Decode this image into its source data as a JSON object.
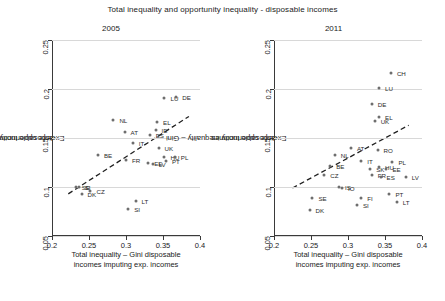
{
  "figure": {
    "title": "Total inequality and opportunity inequality - disposable incomes"
  },
  "axes": {
    "x_title_line1": "Total inequality – Gini disposable",
    "x_title_line2": "incomes imputing exp. incomes",
    "y_title_line1": "Ex-ante opportunity inequality – Gini",
    "y_title_line2": "disposable incomes",
    "x_ticks": [
      "0.2",
      "0.25",
      "0.3",
      "0.35",
      "0.4"
    ],
    "y_ticks": [
      "0.05",
      "0.1",
      "0.15",
      "0.2",
      "0.25"
    ],
    "xlim": [
      0.2,
      0.4
    ],
    "ylim": [
      0.05,
      0.25
    ],
    "marker_color": "#6e6e6e",
    "grid_color": "#d8d8d8",
    "axis_color": "#3a3a3a"
  },
  "chart_data": {
    "type": "scatter",
    "title": "Total inequality and opportunity inequality - disposable incomes",
    "xlabel": "Total inequality – Gini disposable incomes imputing exp. incomes",
    "ylabel": "Ex-ante opportunity inequality – Gini disposable incomes",
    "xlim": [
      0.2,
      0.4
    ],
    "ylim": [
      0.05,
      0.25
    ],
    "grid": true,
    "legend": "none",
    "panels": [
      {
        "name": "2005",
        "label": "2005",
        "trendline": {
          "x0": 0.222,
          "y0": 0.093,
          "x1": 0.385,
          "y1": 0.172
        },
        "points": [
          {
            "label": "SE",
            "x": 0.232,
            "y": 0.1,
            "lx": 6,
            "ly": 0
          },
          {
            "label": "DK",
            "x": 0.24,
            "y": 0.093,
            "lx": 6,
            "ly": 0
          },
          {
            "label": "SI",
            "x": 0.236,
            "y": 0.1,
            "lx": 6,
            "ly": 0
          },
          {
            "label": "BE",
            "x": 0.262,
            "y": 0.133,
            "lx": 6,
            "ly": 0
          },
          {
            "label": "CZ",
            "x": 0.252,
            "y": 0.096,
            "lx": 6,
            "ly": 0
          },
          {
            "label": "NL",
            "x": 0.283,
            "y": 0.168,
            "lx": 6,
            "ly": 0
          },
          {
            "label": "AT",
            "x": 0.298,
            "y": 0.156,
            "lx": 6,
            "ly": 0
          },
          {
            "label": "FR",
            "x": 0.3,
            "y": 0.128,
            "lx": 6,
            "ly": 0
          },
          {
            "label": "IT",
            "x": 0.309,
            "y": 0.145,
            "lx": 6,
            "ly": 0
          },
          {
            "label": "LT",
            "x": 0.313,
            "y": 0.086,
            "lx": 6,
            "ly": 0
          },
          {
            "label": "SI",
            "x": 0.303,
            "y": 0.078,
            "lx": 6,
            "ly": 0
          },
          {
            "label": "ES",
            "x": 0.332,
            "y": 0.153,
            "lx": 6,
            "ly": 0
          },
          {
            "label": "IE",
            "x": 0.34,
            "y": 0.158,
            "lx": 6,
            "ly": 0
          },
          {
            "label": "EE",
            "x": 0.33,
            "y": 0.124,
            "lx": 6,
            "ly": 0
          },
          {
            "label": "LV",
            "x": 0.336,
            "y": 0.123,
            "lx": 6,
            "ly": 0
          },
          {
            "label": "UK",
            "x": 0.344,
            "y": 0.14,
            "lx": 6,
            "ly": 0
          },
          {
            "label": "HU",
            "x": 0.352,
            "y": 0.131,
            "lx": 6,
            "ly": 0
          },
          {
            "label": "PT",
            "x": 0.354,
            "y": 0.127,
            "lx": 6,
            "ly": 0
          },
          {
            "label": "PL",
            "x": 0.366,
            "y": 0.131,
            "lx": 6,
            "ly": 0
          },
          {
            "label": "EL",
            "x": 0.342,
            "y": 0.166,
            "lx": 6,
            "ly": 0
          },
          {
            "label": "LU",
            "x": 0.352,
            "y": 0.191,
            "lx": 6,
            "ly": 0
          },
          {
            "label": "DE",
            "x": 0.368,
            "y": 0.192,
            "lx": 6,
            "ly": 0
          }
        ]
      },
      {
        "name": "2011",
        "label": "2011",
        "trendline": {
          "x0": 0.225,
          "y0": 0.099,
          "x1": 0.382,
          "y1": 0.163
        },
        "points": [
          {
            "label": "SE",
            "x": 0.252,
            "y": 0.089,
            "lx": 6,
            "ly": 0
          },
          {
            "label": "DK",
            "x": 0.248,
            "y": 0.077,
            "lx": 6,
            "ly": 0
          },
          {
            "label": "IS",
            "x": 0.288,
            "y": 0.1,
            "lx": 6,
            "ly": 0
          },
          {
            "label": "IO",
            "x": 0.292,
            "y": 0.099,
            "lx": 6,
            "ly": 0
          },
          {
            "label": "FI",
            "x": 0.318,
            "y": 0.089,
            "lx": 6,
            "ly": 0
          },
          {
            "label": "SI",
            "x": 0.312,
            "y": 0.082,
            "lx": 6,
            "ly": 0
          },
          {
            "label": "NL",
            "x": 0.282,
            "y": 0.133,
            "lx": 6,
            "ly": 0
          },
          {
            "label": "BE",
            "x": 0.276,
            "y": 0.121,
            "lx": 6,
            "ly": 0
          },
          {
            "label": "CZ",
            "x": 0.268,
            "y": 0.112,
            "lx": 6,
            "ly": 0
          },
          {
            "label": "AT",
            "x": 0.304,
            "y": 0.14,
            "lx": 6,
            "ly": 0
          },
          {
            "label": "IT",
            "x": 0.318,
            "y": 0.127,
            "lx": 6,
            "ly": 0
          },
          {
            "label": "RO",
            "x": 0.34,
            "y": 0.138,
            "lx": 6,
            "ly": 0
          },
          {
            "label": "DE",
            "x": 0.332,
            "y": 0.185,
            "lx": 6,
            "ly": 0
          },
          {
            "label": "LU",
            "x": 0.342,
            "y": 0.201,
            "lx": 6,
            "ly": 0
          },
          {
            "label": "CH",
            "x": 0.358,
            "y": 0.216,
            "lx": 6,
            "ly": 0
          },
          {
            "label": "EL",
            "x": 0.342,
            "y": 0.171,
            "lx": 6,
            "ly": 0
          },
          {
            "label": "UK",
            "x": 0.336,
            "y": 0.167,
            "lx": 6,
            "ly": 0
          },
          {
            "label": "SK",
            "x": 0.33,
            "y": 0.118,
            "lx": 6,
            "ly": 0
          },
          {
            "label": "HU",
            "x": 0.342,
            "y": 0.12,
            "lx": 6,
            "ly": 0
          },
          {
            "label": "EE",
            "x": 0.352,
            "y": 0.118,
            "lx": 6,
            "ly": 0
          },
          {
            "label": "FR",
            "x": 0.332,
            "y": 0.112,
            "lx": 6,
            "ly": 0
          },
          {
            "label": "ES",
            "x": 0.344,
            "y": 0.11,
            "lx": 6,
            "ly": 0
          },
          {
            "label": "PL",
            "x": 0.36,
            "y": 0.126,
            "lx": 6,
            "ly": 0
          },
          {
            "label": "LV",
            "x": 0.378,
            "y": 0.11,
            "lx": 6,
            "ly": 0
          },
          {
            "label": "PT",
            "x": 0.356,
            "y": 0.093,
            "lx": 6,
            "ly": 0
          },
          {
            "label": "LT",
            "x": 0.366,
            "y": 0.085,
            "lx": 6,
            "ly": 0
          }
        ]
      }
    ]
  }
}
